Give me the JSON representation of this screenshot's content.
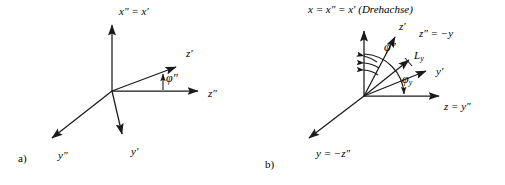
{
  "figure": {
    "background_color": "#ffffff",
    "stroke_color": "#1a1a1a",
    "type": "vector-axis-diagram"
  },
  "panels": [
    {
      "id": "a",
      "caption": "a)",
      "origin": {
        "x": 112,
        "y": 91
      },
      "axes": [
        {
          "name": "x-double-prime-equals-x-prime-axis",
          "label": "x″ = x′",
          "label_x": 119,
          "label_y": 12,
          "tip": {
            "x": 112,
            "y": 22
          }
        },
        {
          "name": "z-prime-axis",
          "label": "z′",
          "label_x": 188,
          "label_y": 54,
          "tip": {
            "x": 180,
            "y": 64
          }
        },
        {
          "name": "z-double-prime-axis",
          "label": "z″",
          "label_x": 212,
          "label_y": 94,
          "tip": {
            "x": 203,
            "y": 91
          }
        },
        {
          "name": "y-prime-axis",
          "label": "y′",
          "label_x": 129,
          "label_y": 155,
          "tip": {
            "x": 123,
            "y": 140
          }
        },
        {
          "name": "y-double-prime-axis",
          "label": "y″",
          "label_x": 57,
          "label_y": 158,
          "tip": {
            "x": 48,
            "y": 143
          }
        }
      ],
      "angles": [
        {
          "name": "phi-double-prime-angle",
          "label": "φ″",
          "label_x": 166,
          "label_y": 80
        }
      ]
    },
    {
      "id": "b",
      "caption": "b)",
      "origin": {
        "x": 364,
        "y": 96
      },
      "title": "x = x″ = x′ (Drehachse)",
      "title_x": 311,
      "title_y": 10,
      "axes": [
        {
          "name": "x-rotation-axis",
          "label": "",
          "tip": {
            "x": 364,
            "y": 28
          }
        },
        {
          "name": "z-prime-axis",
          "label": "z′",
          "label_x": 404,
          "label_y": 27,
          "tip": {
            "x": 398,
            "y": 33
          }
        },
        {
          "name": "l-y-vector",
          "label": "L",
          "sub": "y",
          "label_x": 428,
          "label_y": 57,
          "tip": {
            "x": 412,
            "y": 57
          }
        },
        {
          "name": "y-prime-axis",
          "label": "y′",
          "label_x": 441,
          "label_y": 76,
          "tip": {
            "x": 431,
            "y": 78
          }
        },
        {
          "name": "z-equals-y-double-prime-axis",
          "label": "z = y″",
          "label_x": 448,
          "label_y": 110,
          "tip": {
            "x": 444,
            "y": 96
          }
        },
        {
          "name": "y-equals-minus-z-double-prime-axis",
          "label": "y = −z″",
          "label_x": 315,
          "label_y": 158,
          "tip": {
            "x": 305,
            "y": 142
          }
        },
        {
          "name": "z-double-prime-equals-minus-y-label",
          "label": "z″ = −y",
          "label_x": 423,
          "label_y": 35
        }
      ],
      "angles": [
        {
          "name": "phi-double-prime-angle",
          "label": "φ″",
          "label_x": 386,
          "label_y": 47
        },
        {
          "name": "phi-y-angle",
          "label": "φ",
          "sub": "y",
          "label_x": 404,
          "label_y": 80
        }
      ]
    }
  ],
  "labels": {
    "panel_a_caption": "a)",
    "panel_b_caption": "b)",
    "panel_b_title": "(Drehachse)",
    "rotation_axis_text": "x = x″ = x′"
  }
}
